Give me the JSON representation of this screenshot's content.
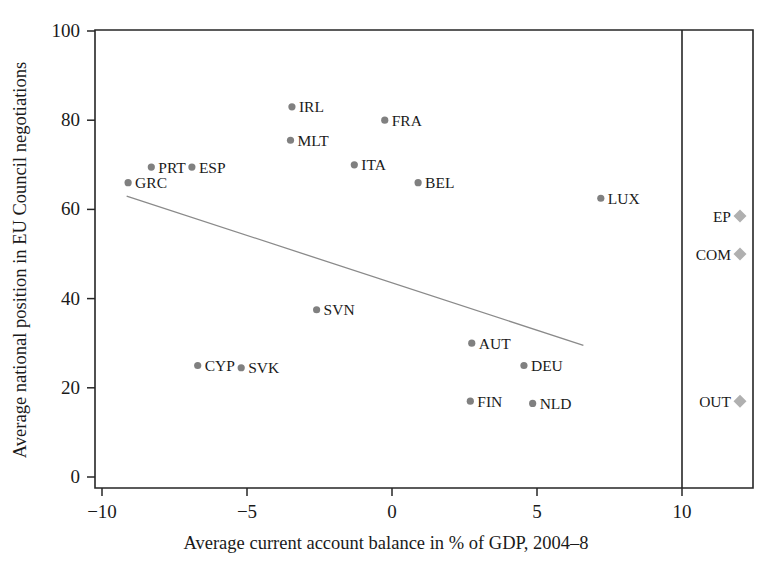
{
  "chart_data": {
    "type": "scatter",
    "title": "",
    "xlabel": "Average current account balance in % of GDP, 2004–8",
    "ylabel": "Average national position in EU Council negotiations",
    "xlim": [
      -10.6,
      13.0
    ],
    "ylim": [
      -1.5,
      103.0
    ],
    "xticks": [
      -10,
      -5,
      0,
      5,
      10
    ],
    "xticklabels": [
      "−10",
      "−5",
      "0",
      "5",
      "10"
    ],
    "yticks": [
      0,
      20,
      40,
      60,
      80,
      100
    ],
    "yticklabels": [
      "0",
      "20",
      "40",
      "60",
      "80",
      "100"
    ],
    "grid": false,
    "legend": null,
    "points": [
      {
        "label": "GRC",
        "x": -9.1,
        "y": 66,
        "label_side": "right"
      },
      {
        "label": "PRT",
        "x": -8.3,
        "y": 69.5,
        "label_side": "right"
      },
      {
        "label": "ESP",
        "x": -6.9,
        "y": 69.5,
        "label_side": "right"
      },
      {
        "label": "CYP",
        "x": -6.7,
        "y": 25,
        "label_side": "right"
      },
      {
        "label": "SVK",
        "x": -5.2,
        "y": 24.5,
        "label_side": "right"
      },
      {
        "label": "IRL",
        "x": -3.45,
        "y": 83,
        "label_side": "right"
      },
      {
        "label": "MLT",
        "x": -3.5,
        "y": 75.5,
        "label_side": "right"
      },
      {
        "label": "SVN",
        "x": -2.6,
        "y": 37.5,
        "label_side": "right"
      },
      {
        "label": "ITA",
        "x": -1.3,
        "y": 70,
        "label_side": "right"
      },
      {
        "label": "FRA",
        "x": -0.25,
        "y": 80,
        "label_side": "right"
      },
      {
        "label": "BEL",
        "x": 0.9,
        "y": 66,
        "label_side": "right"
      },
      {
        "label": "AUT",
        "x": 2.75,
        "y": 30,
        "label_side": "right"
      },
      {
        "label": "FIN",
        "x": 2.7,
        "y": 17,
        "label_side": "right"
      },
      {
        "label": "DEU",
        "x": 4.55,
        "y": 25,
        "label_side": "right"
      },
      {
        "label": "NLD",
        "x": 4.85,
        "y": 16.5,
        "label_side": "right"
      },
      {
        "label": "LUX",
        "x": 7.2,
        "y": 62.5,
        "label_side": "right"
      }
    ],
    "institution_points": [
      {
        "label": "EP",
        "x": 12.0,
        "y": 58.5,
        "label_side": "left"
      },
      {
        "label": "COM",
        "x": 12.0,
        "y": 50,
        "label_side": "left"
      },
      {
        "label": "OUT",
        "x": 12.0,
        "y": 17,
        "label_side": "left"
      }
    ],
    "trend_line": {
      "x_start": -9.15,
      "y_start": 63.0,
      "x_end": 6.6,
      "y_end": 29.5
    },
    "panel_divider_x": 10,
    "colors": {
      "point": "#808080",
      "institution_point": "#b0b0b0",
      "trend": "#8a8a8a",
      "axis": "#262626",
      "text": "#1a1a1a",
      "background": "#ffffff"
    }
  }
}
